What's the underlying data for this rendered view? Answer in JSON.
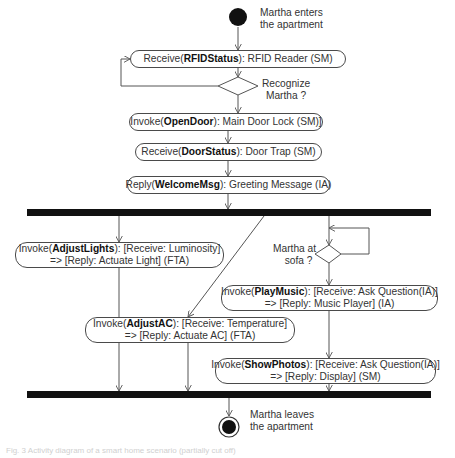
{
  "diagram": {
    "type": "UML activity diagram",
    "start_label": [
      "Martha enters",
      "the apartment"
    ],
    "end_label": [
      "Martha leaves",
      "the apartment"
    ],
    "nodes": [
      {
        "id": "rfid",
        "prefix": "Receive(",
        "bold": "RFIDStatus",
        "suffix": "): RFID Reader (SM)",
        "line2": ""
      },
      {
        "id": "opendoor",
        "prefix": "Invoke(",
        "bold": "OpenDoor",
        "suffix": "): Main Door Lock (SM)]",
        "line2": ""
      },
      {
        "id": "doorstatus",
        "prefix": "Receive(",
        "bold": "DoorStatus",
        "suffix": "): Door Trap (SM)",
        "line2": ""
      },
      {
        "id": "welcome",
        "prefix": "Reply(",
        "bold": "WelcomeMsg",
        "suffix": "): Greeting Message (IA)",
        "line2": ""
      },
      {
        "id": "adjustlights",
        "prefix": "Invoke(",
        "bold": "AdjustLights",
        "suffix": "): [Receive: Luminosity]",
        "line2": "=> [Reply: Actuate Light] (FTA)"
      },
      {
        "id": "playmusic",
        "prefix": "Invoke(",
        "bold": "PlayMusic",
        "suffix": "): [Receive: Ask Question(IA)]",
        "line2": "=> [Reply: Music Player] (IA)"
      },
      {
        "id": "adjustac",
        "prefix": "Invoke(",
        "bold": "AdjustAC",
        "suffix": "): [Receive: Temperature]",
        "line2": "=> [Reply: Actuate AC] (FTA)"
      },
      {
        "id": "showphotos",
        "prefix": "Invoke(",
        "bold": "ShowPhotos",
        "suffix": "): [Receive: Ask Question(IA)]",
        "line2": "=> [Reply: Display] (SM)"
      }
    ],
    "decisions": [
      {
        "id": "recognize",
        "label": [
          "Recognize",
          "Martha ?"
        ]
      },
      {
        "id": "sofa",
        "label": [
          "Martha at",
          "sofa ?"
        ]
      }
    ],
    "bars": [
      {
        "id": "fork",
        "kind": "fork"
      },
      {
        "id": "join",
        "kind": "join"
      }
    ],
    "colors": {
      "line": "#555555",
      "bar": "#111111",
      "border": "#4a4a4a",
      "text": "#333333"
    }
  },
  "caption": "Fig. 3 Activity diagram of a smart home scenario (partially cut off)"
}
